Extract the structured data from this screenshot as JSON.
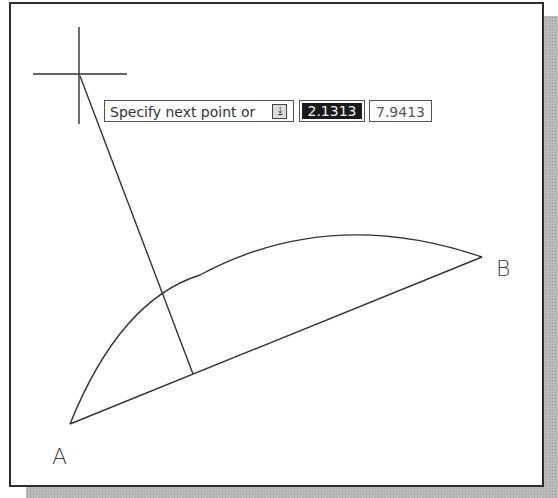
{
  "prompt": {
    "text": "Specify next point or",
    "icon": "down-arrow-icon"
  },
  "inputs": {
    "length_value": "2.1313",
    "angle_value": "7.9413"
  },
  "points": {
    "a_label": "A",
    "b_label": "B"
  },
  "geometry": {
    "crosshair": [
      80,
      75
    ],
    "point_a": [
      70,
      424
    ],
    "point_b": [
      482,
      257
    ],
    "arc_top": [
      350,
      230
    ],
    "arc_line_intersection": [
      164,
      298
    ],
    "chord_foot": [
      193,
      374
    ]
  }
}
